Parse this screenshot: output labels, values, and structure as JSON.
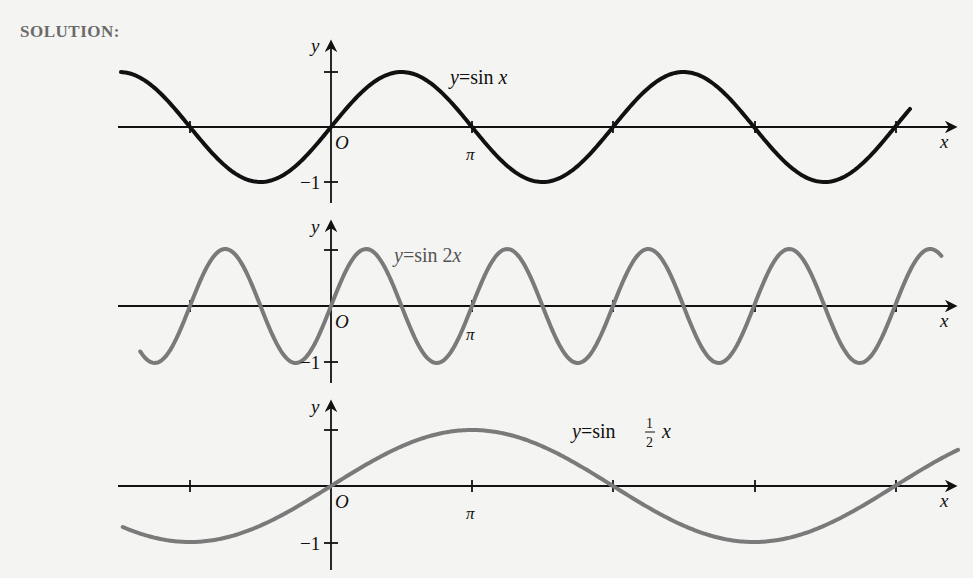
{
  "heading": "SOLUTION:",
  "colors": {
    "curve1": "#111111",
    "curve2": "#7a7a7a",
    "curve3": "#7a7a7a",
    "axis": "#111111",
    "background": "#f4f4f2"
  },
  "chart_data": [
    {
      "type": "line",
      "title": "y = sin x",
      "xlabel": "x",
      "ylabel": "y",
      "x_ticks": [
        "-π",
        "O",
        "π",
        "2π",
        "3π",
        "4π"
      ],
      "x_tick_labels_shown": [
        "O",
        "π"
      ],
      "y_ticks": [
        1,
        -1
      ],
      "y_tick_labels_shown": [
        "-1"
      ],
      "function": "sin(x)",
      "x_range": [
        -4.68,
        12.9
      ],
      "ylim": [
        -1,
        1
      ],
      "series": [
        {
          "name": "y = sin x",
          "x": [
            -4.71,
            -3.14,
            -1.57,
            0,
            1.57,
            3.14,
            4.71,
            6.28,
            7.85,
            9.42,
            11.0,
            12.57
          ],
          "values": [
            1,
            0,
            -1,
            0,
            1,
            0,
            -1,
            0,
            1,
            0,
            -1,
            0
          ]
        }
      ]
    },
    {
      "type": "line",
      "title": "y = sin 2x",
      "xlabel": "x",
      "ylabel": "y",
      "x_ticks": [
        "-π",
        "O",
        "π",
        "2π",
        "3π",
        "4π"
      ],
      "x_tick_labels_shown": [
        "O",
        "π"
      ],
      "y_ticks": [
        1,
        -1
      ],
      "y_tick_labels_shown": [
        "-1"
      ],
      "function": "sin(2x)",
      "x_range": [
        -4.25,
        13.6
      ],
      "ylim": [
        -1,
        1
      ],
      "series": [
        {
          "name": "y = sin 2x",
          "x": [
            -3.93,
            -3.14,
            -2.36,
            -1.57,
            -0.79,
            0,
            0.79,
            1.57,
            2.36,
            3.14
          ],
          "values": [
            -1,
            0,
            1,
            0,
            -1,
            0,
            1,
            0,
            -1,
            0
          ]
        }
      ]
    },
    {
      "type": "line",
      "title": "y = sin ½ x",
      "xlabel": "x",
      "ylabel": "y",
      "x_ticks": [
        "-π",
        "O",
        "π",
        "2π",
        "3π",
        "4π"
      ],
      "x_tick_labels_shown": [
        "O",
        "π"
      ],
      "y_ticks": [
        1,
        -1
      ],
      "y_tick_labels_shown": [
        "-1"
      ],
      "function": "sin(x/2)",
      "x_range": [
        -4.64,
        13.97
      ],
      "ylim": [
        -1,
        1
      ],
      "series": [
        {
          "name": "y = sin ½ x",
          "x": [
            -3.14,
            0,
            3.14,
            6.28,
            9.42,
            12.57
          ],
          "values": [
            -1,
            0,
            1,
            0,
            -1,
            0
          ]
        }
      ]
    }
  ],
  "graphs": [
    {
      "label": "y=sin x",
      "eq_y": "y",
      "eq_rest": "=sin ",
      "eq_var": "x",
      "origin": "O",
      "pi": "π",
      "neg_one": "−1",
      "xaxis": "x",
      "yaxis": "y"
    },
    {
      "label": "y=sin 2x",
      "eq_y": "y",
      "eq_rest": "=sin 2",
      "eq_var": "x",
      "origin": "O",
      "pi": "π",
      "neg_one": "−1",
      "xaxis": "x",
      "yaxis": "y"
    },
    {
      "label": "y=sin ½ x",
      "eq_y": "y",
      "eq_rest": "=sin ",
      "eq_num": "1",
      "eq_den": "2",
      "eq_var": "x",
      "origin": "O",
      "pi": "π",
      "neg_one": "−1",
      "xaxis": "x",
      "yaxis": "y"
    }
  ]
}
